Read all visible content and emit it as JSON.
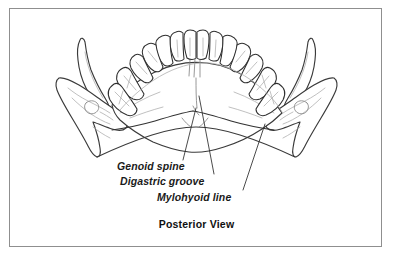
{
  "figure": {
    "caption": "Posterior View",
    "background_color": "#ffffff",
    "frame_color": "#8f8f8f",
    "outline_color": "#3a3a3a",
    "detail_color": "#b0b0b0",
    "label_color": "#1a1a1a"
  },
  "labels": [
    {
      "id": "genoid-spine",
      "text": "Genoid spine",
      "style": "bold-italic"
    },
    {
      "id": "digastric-groove",
      "text": "Digastric groove",
      "style": "bold-italic"
    },
    {
      "id": "mylohyoid-line",
      "text": "Mylohyoid line",
      "style": "bold-italic"
    }
  ],
  "caption": {
    "text": "Posterior View",
    "style": "bold"
  },
  "anatomy": {
    "structures": [
      "mandible-body",
      "left-ramus",
      "right-ramus",
      "left-coronoid-process",
      "right-coronoid-process",
      "left-condyle",
      "right-condyle",
      "dental-arch",
      "mylohyoid-line-ridge",
      "genoid-spine-ridge",
      "digastric-groove-fossa"
    ],
    "tooth_count": 14
  }
}
